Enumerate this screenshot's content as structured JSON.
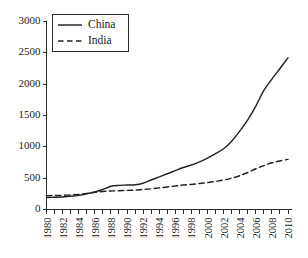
{
  "chart_data": {
    "type": "line",
    "title": "",
    "xlabel": "",
    "ylabel": "",
    "xlim": [
      1980,
      2010
    ],
    "ylim": [
      0,
      3000
    ],
    "grid": false,
    "legend_position": "top-left",
    "x": [
      1980,
      1981,
      1982,
      1983,
      1984,
      1985,
      1986,
      1987,
      1988,
      1989,
      1990,
      1991,
      1992,
      1993,
      1994,
      1995,
      1996,
      1997,
      1998,
      1999,
      2000,
      2001,
      2002,
      2003,
      2004,
      2005,
      2006,
      2007,
      2008,
      2009,
      2010
    ],
    "xticks": [
      1980,
      1982,
      1984,
      1986,
      1988,
      1990,
      1992,
      1994,
      1996,
      1998,
      2000,
      2002,
      2004,
      2006,
      2008,
      2010
    ],
    "xtick_labels": [
      "1980",
      "1982",
      "1984",
      "1986",
      "1988",
      "1990",
      "1992",
      "1994",
      "1996",
      "1998",
      "2000",
      "2002",
      "2004",
      "2006",
      "2008",
      "2010"
    ],
    "xticks_minor": [
      1981,
      1983,
      1985,
      1987,
      1989,
      1991,
      1993,
      1995,
      1997,
      1999,
      2001,
      2003,
      2005,
      2007,
      2009
    ],
    "yticks": [
      0,
      500,
      1000,
      1500,
      2000,
      2500,
      3000
    ],
    "ytick_labels": [
      "0",
      "500",
      "1000",
      "1500",
      "2000",
      "2500",
      "3000"
    ],
    "series": [
      {
        "name": "China",
        "style": "solid",
        "color": "#222222",
        "values": [
          190,
          195,
          200,
          210,
          225,
          250,
          280,
          320,
          370,
          385,
          390,
          395,
          420,
          470,
          520,
          570,
          620,
          670,
          710,
          760,
          820,
          890,
          970,
          1090,
          1250,
          1430,
          1650,
          1900,
          2080,
          2250,
          2420
        ]
      },
      {
        "name": "India",
        "style": "dashed",
        "color": "#222222",
        "values": [
          220,
          222,
          226,
          232,
          240,
          255,
          275,
          288,
          295,
          300,
          305,
          310,
          320,
          330,
          345,
          360,
          375,
          390,
          400,
          415,
          430,
          450,
          470,
          500,
          540,
          590,
          650,
          700,
          745,
          775,
          800
        ]
      }
    ]
  },
  "legend": {
    "entries": [
      {
        "label": "China",
        "style": "solid"
      },
      {
        "label": "India",
        "style": "dashed"
      }
    ]
  }
}
